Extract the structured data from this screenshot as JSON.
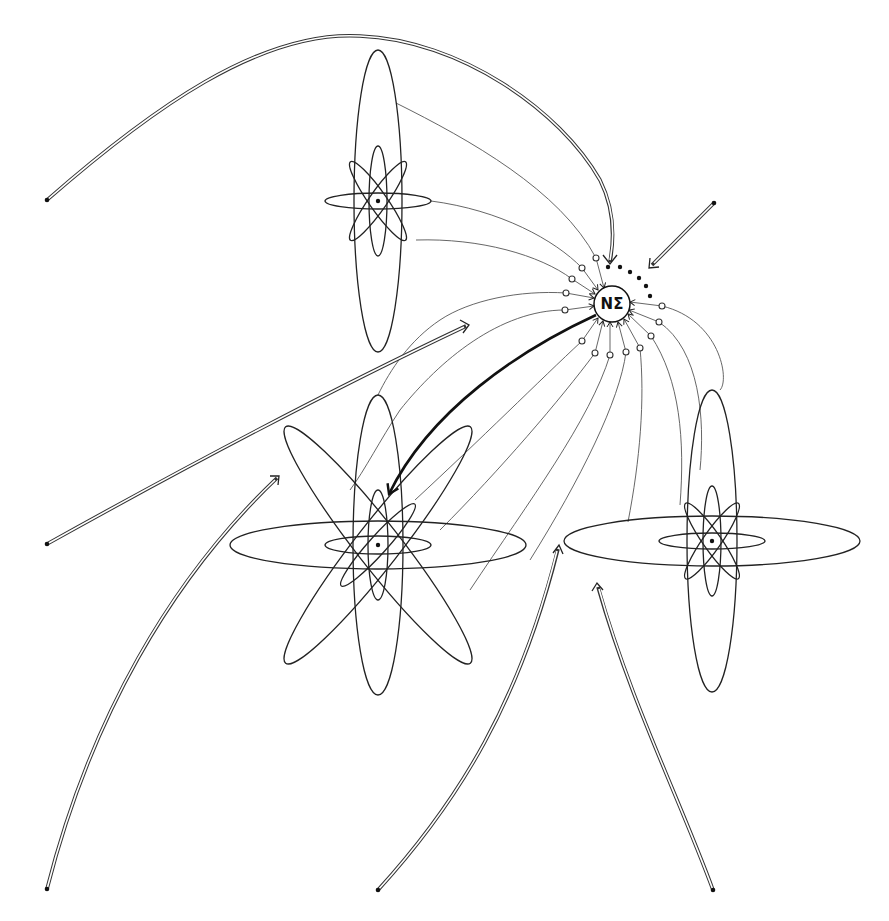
{
  "diagram": {
    "nucleus": {
      "label": "NΣ",
      "cx": 612,
      "cy": 304,
      "r": 18
    },
    "atoms": [
      {
        "name": "atom-top-left",
        "cx": 378,
        "cy": 201,
        "big_vertical": true,
        "big_horizontal": false,
        "big_diagonals": false
      },
      {
        "name": "atom-bottom-left",
        "cx": 378,
        "cy": 545,
        "big_vertical": true,
        "big_horizontal": true,
        "big_diagonals": true
      },
      {
        "name": "atom-right",
        "cx": 712,
        "cy": 541,
        "big_vertical": true,
        "big_horizontal": true,
        "big_diagonals": false
      }
    ],
    "input_arrows": [
      {
        "name": "arrow-top-arc",
        "start": [
          47,
          200
        ],
        "end": [
          610,
          262
        ]
      },
      {
        "name": "arrow-right-diagonal",
        "start": [
          714,
          203
        ],
        "end": [
          649,
          268
        ]
      },
      {
        "name": "arrow-left-middle",
        "start": [
          47,
          544
        ],
        "end": [
          469,
          325
        ]
      },
      {
        "name": "arrow-bottom-left",
        "start": [
          47,
          889
        ],
        "end": [
          279,
          476
        ]
      },
      {
        "name": "arrow-bottom-middle",
        "start": [
          378,
          890
        ],
        "end": [
          559,
          546
        ]
      },
      {
        "name": "arrow-bottom-right",
        "start": [
          713,
          890
        ],
        "end": [
          597,
          584
        ]
      }
    ],
    "output_arrow": {
      "name": "thick-arrow-nucleus-to-atom",
      "start": [
        596,
        315
      ],
      "end": [
        387,
        497
      ]
    },
    "ports_count": 13,
    "pending_dots_count": 6,
    "colors": {
      "ink": "#111111",
      "background": "#ffffff",
      "link": "#555555"
    }
  }
}
